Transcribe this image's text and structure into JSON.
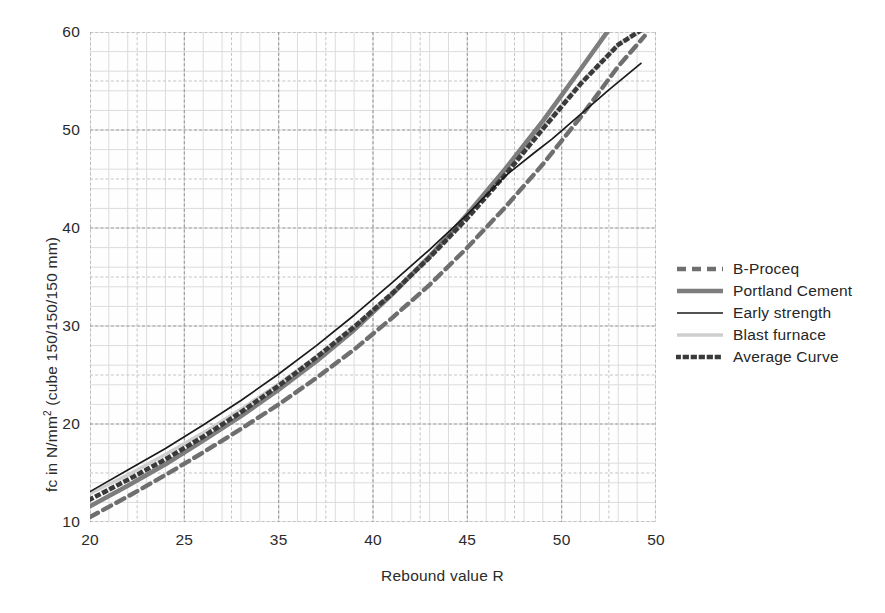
{
  "chart_data": {
    "type": "line",
    "title": "",
    "xlabel": "Rebound value R",
    "ylabel": "fc in N/mm² (cube 150/150/150 mm)",
    "ylabel_parts": {
      "pre": "fc in N/mm",
      "sup": "2",
      "post": " (cube 150/150/150 mm)"
    },
    "xlim": [
      20,
      50
    ],
    "ylim": [
      10,
      60
    ],
    "xticks": [
      20,
      25,
      30,
      35,
      40,
      45,
      50
    ],
    "xtick_labels": [
      "20",
      "25",
      "35",
      "40",
      "45",
      "50"
    ],
    "xtick_label_positions": [
      20,
      25,
      30,
      35,
      40,
      45
    ],
    "xtick_labels_note": "Third label printed as 35 in the original where 30 is expected; last tick 50 labelled at x=50",
    "yticks": [
      10,
      20,
      30,
      40,
      50,
      60
    ],
    "ytick_labels": [
      "10",
      "20",
      "30",
      "40",
      "50",
      "60"
    ],
    "grid": true,
    "grid_minor_x_step": 1,
    "grid_minor_y_step": 2,
    "legend_position": "right",
    "series": [
      {
        "name": "B-Proceq",
        "style": "dashed",
        "color": "#6f6f6f",
        "width": 4.4,
        "dash": "9,6",
        "x": [
          20,
          22,
          24,
          26,
          28,
          30,
          32,
          34,
          36,
          38,
          40,
          42,
          44,
          46,
          48,
          49.4
        ],
        "y": [
          10.5,
          12.6,
          14.8,
          17.1,
          19.5,
          22.0,
          24.7,
          27.6,
          30.8,
          34.2,
          38.0,
          42.1,
          46.5,
          51.3,
          56.5,
          59.6
        ]
      },
      {
        "name": "Portland Cement",
        "style": "solid",
        "color": "#7d7d7d",
        "width": 4.6,
        "dash": "",
        "x": [
          20,
          22,
          24,
          26,
          28,
          30,
          32,
          34,
          36,
          38,
          40,
          42,
          44,
          46,
          47.6
        ],
        "y": [
          11.6,
          13.7,
          15.9,
          18.3,
          20.8,
          23.5,
          26.4,
          29.6,
          33.2,
          37.1,
          41.4,
          46.0,
          50.9,
          56.2,
          60.5
        ]
      },
      {
        "name": "Early strength",
        "style": "solid",
        "color": "#1a1a1a",
        "width": 1.7,
        "dash": "",
        "x": [
          20,
          22,
          24,
          26,
          28,
          30,
          32,
          34,
          36,
          38,
          40,
          42,
          43.5,
          44.5,
          46,
          47.5,
          49.2
        ],
        "y": [
          13.1,
          15.3,
          17.5,
          19.9,
          22.4,
          25.1,
          28.0,
          31.1,
          34.4,
          37.8,
          41.4,
          45.3,
          47.6,
          49.1,
          51.6,
          54.1,
          56.8
        ]
      },
      {
        "name": "Blast furnace",
        "style": "solid",
        "color": "#cfcfcf",
        "width": 3.4,
        "dash": "",
        "x": [
          20,
          22,
          24,
          26,
          28,
          30,
          32,
          34,
          36,
          38,
          40,
          42,
          44,
          46,
          48,
          49.3
        ],
        "y": [
          12.9,
          14.8,
          16.9,
          19.1,
          21.5,
          24.1,
          26.9,
          30.0,
          33.4,
          37.1,
          41.2,
          45.7,
          50.3,
          54.8,
          58.7,
          60.3
        ]
      },
      {
        "name": "Average Curve",
        "style": "dotted",
        "color": "#3a3a3a",
        "width": 4.6,
        "dash": "1.6,6.4",
        "x": [
          20,
          22,
          24,
          26,
          28,
          30,
          32,
          34,
          36,
          38,
          40,
          42,
          44,
          46,
          48,
          49.3
        ],
        "y": [
          12.3,
          14.3,
          16.4,
          18.7,
          21.2,
          23.9,
          26.8,
          29.9,
          33.3,
          37.0,
          41.0,
          45.4,
          50.1,
          54.7,
          58.7,
          60.3
        ]
      }
    ]
  },
  "legend": {
    "entries": [
      {
        "label": "B-Proceq",
        "swatch": "thick-dashed-line-icon"
      },
      {
        "label": "Portland Cement",
        "swatch": "thick-solid-gray-line-icon"
      },
      {
        "label": "Early strength",
        "swatch": "thin-solid-black-line-icon"
      },
      {
        "label": "Blast furnace",
        "swatch": "thin-light-gray-line-icon"
      },
      {
        "label": "Average Curve",
        "swatch": "dotted-square-line-icon"
      }
    ]
  }
}
